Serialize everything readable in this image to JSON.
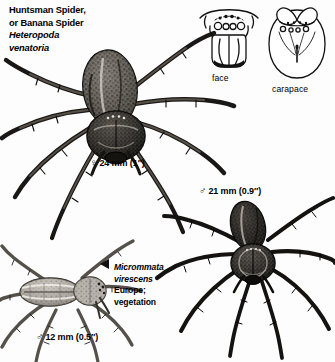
{
  "page": {
    "background": "#fdfdfd",
    "ink": "#111111"
  },
  "title": {
    "line1": "Huntsman Spider,",
    "line2": "or Banana Spider",
    "line3": "Heteropoda",
    "line4": "venatoria"
  },
  "labels": {
    "female_heteropoda": {
      "symbol": "♀",
      "text": "24 mm (1″)"
    },
    "male_heteropoda": {
      "symbol": "♂",
      "text": "21 mm (0.9″)"
    },
    "male_micrommata": {
      "symbol": "♂",
      "text": "12 mm (0.5″)"
    }
  },
  "insets": {
    "face_caption": "face",
    "carapace_caption": "carapace"
  },
  "micrommata": {
    "genus": "Micrommata",
    "species": "virescens",
    "region": "Europe;",
    "habitat": "vegetation"
  },
  "figures": {
    "female_heteropoda": "huntsman-spider-female-dorsal-illustration",
    "male_heteropoda": "huntsman-spider-male-dorsal-illustration",
    "male_micrommata": "micrommata-virescens-male-dorsal-illustration",
    "face_diagram": "spider-face-eye-arrangement-diagram",
    "carapace_diagram": "spider-carapace-eye-arrangement-diagram"
  }
}
